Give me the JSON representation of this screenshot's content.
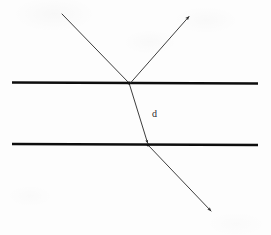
{
  "figure": {
    "kind": "optics-refraction-slab-diagram",
    "canvas": {
      "width": 271,
      "height": 235
    },
    "background_color": "#fdfdfd",
    "ink_color": "#111111",
    "ray_color": "#3a3a3a"
  },
  "labels": [
    {
      "id": "slab-thickness",
      "text": "d",
      "x": 152,
      "y": 117,
      "font_size": 10,
      "color": "#2b2b2b"
    }
  ],
  "boundaries": [
    {
      "id": "upper-surface",
      "name": "upper-boundary-line",
      "x1": 12,
      "y1": 82.5,
      "x2": 258,
      "y2": 83.5,
      "thickness": 2.6,
      "color": "#0d0d0d"
    },
    {
      "id": "lower-surface",
      "name": "lower-boundary-line",
      "x1": 12,
      "y1": 144.0,
      "x2": 258,
      "y2": 145.0,
      "thickness": 2.6,
      "color": "#0d0d0d"
    }
  ],
  "rays": [
    {
      "id": "incident-ray",
      "name": "incident-ray",
      "x1": 62,
      "y1": 14,
      "x2": 129,
      "y2": 83,
      "thickness": 1.0,
      "color": "#3d3d3d",
      "arrowhead": "none"
    },
    {
      "id": "reflected-ray",
      "name": "reflected-ray",
      "x1": 130,
      "y1": 83,
      "x2": 190,
      "y2": 15,
      "thickness": 1.0,
      "color": "#3d3d3d",
      "arrowhead": "end"
    },
    {
      "id": "refracted-ray",
      "name": "refracted-ray-in-slab",
      "x1": 129,
      "y1": 83,
      "x2": 148,
      "y2": 145,
      "thickness": 1.0,
      "color": "#3d3d3d",
      "arrowhead": "end"
    },
    {
      "id": "emergent-ray",
      "name": "emergent-ray",
      "x1": 148,
      "y1": 145,
      "x2": 212,
      "y2": 212,
      "thickness": 1.0,
      "color": "#3d3d3d",
      "arrowhead": "end"
    }
  ],
  "nodes": [
    {
      "id": "entry-point",
      "name": "upper-intersection-point",
      "x": 129,
      "y": 83
    },
    {
      "id": "exit-point",
      "name": "lower-intersection-point",
      "x": 148,
      "y": 145
    }
  ],
  "chart_data": {
    "type": "diagram",
    "title": "",
    "annotations": [
      "d"
    ]
  }
}
